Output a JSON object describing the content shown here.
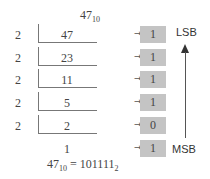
{
  "title": {
    "number": "47",
    "base": "10"
  },
  "rows": [
    {
      "divisor": "2",
      "dividend": "47",
      "remainder": "1"
    },
    {
      "divisor": "2",
      "dividend": "23",
      "remainder": "1"
    },
    {
      "divisor": "2",
      "dividend": "11",
      "remainder": "1"
    },
    {
      "divisor": "2",
      "dividend": "5",
      "remainder": "1"
    },
    {
      "divisor": "2",
      "dividend": "2",
      "remainder": "0"
    }
  ],
  "final": {
    "quotient": "1",
    "remainder": "1"
  },
  "arrow_glyph": "→",
  "labels": {
    "lsb": "LSB",
    "msb": "MSB"
  },
  "equation": {
    "lhs": "47",
    "lhs_base": "10",
    "equals": "=",
    "rhs": "101111",
    "rhs_base": "2"
  },
  "colors": {
    "box_fill": "#c4c4c4",
    "line": "#777777",
    "text": "#444444"
  }
}
